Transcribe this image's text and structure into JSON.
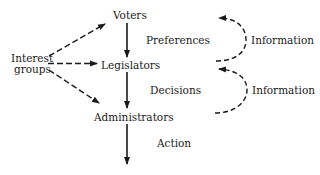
{
  "diagram": {
    "nodes": {
      "voters": "Voters",
      "legislators": "Legislators",
      "administrators": "Administrators",
      "interest_groups_line1": "Interest",
      "interest_groups_line2": "groups"
    },
    "edge_labels": {
      "preferences": "Preferences",
      "decisions": "Decisions",
      "action": "Action"
    },
    "feedback_labels": {
      "info_top": "Information",
      "info_bottom": "Information"
    },
    "edges": [
      {
        "from": "Voters",
        "to": "Legislators",
        "label": "Preferences",
        "style": "solid"
      },
      {
        "from": "Legislators",
        "to": "Administrators",
        "label": "Decisions",
        "style": "solid"
      },
      {
        "from": "Administrators",
        "to": "(output)",
        "label": "Action",
        "style": "solid"
      },
      {
        "from": "Interest groups",
        "to": "Voters",
        "style": "dashed"
      },
      {
        "from": "Interest groups",
        "to": "Legislators",
        "style": "dashed"
      },
      {
        "from": "Interest groups",
        "to": "Administrators",
        "style": "dashed"
      },
      {
        "from": "Legislators level",
        "to": "Voters level",
        "label": "Information",
        "style": "dashed-loop"
      },
      {
        "from": "Administrators level",
        "to": "Legislators level",
        "label": "Information",
        "style": "dashed-loop"
      }
    ],
    "colors": {
      "ink": "#1a1a1a",
      "background": "#ffffff"
    }
  }
}
